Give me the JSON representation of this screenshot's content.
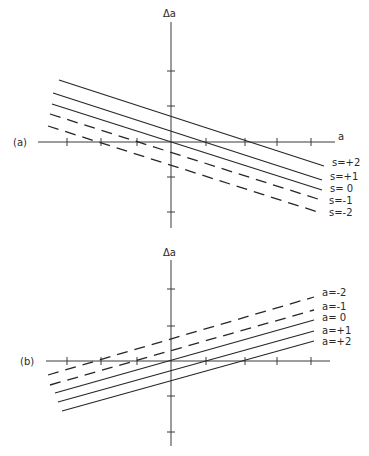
{
  "figure": {
    "panels": [
      {
        "id": "a",
        "panel_label": "(a)",
        "y_axis_label": "Δa",
        "x_axis_label": "a",
        "origin": [
          171,
          142
        ],
        "x_axis": [
          38,
          335
        ],
        "y_axis": [
          22,
          228
        ],
        "x_ticks": [
          67,
          101,
          137,
          206,
          245,
          277,
          311
        ],
        "y_ticks": [
          71,
          106,
          177,
          212
        ],
        "lines": [
          {
            "label": "s=+2",
            "style": "solid",
            "x1": 59,
            "y1": 80,
            "x2": 324,
            "y2": 166,
            "label_y": 162
          },
          {
            "label": "s=+1",
            "style": "solid",
            "x1": 53,
            "y1": 93,
            "x2": 322,
            "y2": 180,
            "label_y": 176
          },
          {
            "label": "s= 0",
            "style": "solid",
            "x1": 52,
            "y1": 104,
            "x2": 322,
            "y2": 190,
            "label_y": 188
          },
          {
            "label": "s=-1",
            "style": "dashed",
            "x1": 50,
            "y1": 114,
            "x2": 321,
            "y2": 200,
            "label_y": 200
          },
          {
            "label": "s=-2",
            "style": "dashed",
            "x1": 48,
            "y1": 126,
            "x2": 321,
            "y2": 213,
            "label_y": 212
          }
        ]
      },
      {
        "id": "b",
        "panel_label": "(b)",
        "y_axis_label": "Δa",
        "x_axis_label": "",
        "origin": [
          171,
          361
        ],
        "x_axis": [
          46,
          330
        ],
        "y_axis": [
          260,
          446
        ],
        "x_ticks": [
          67,
          101,
          137,
          206,
          245,
          277,
          311
        ],
        "y_ticks": [
          289,
          326,
          396,
          432
        ],
        "lines": [
          {
            "label": "a=-2",
            "style": "dashed",
            "x1": 48,
            "y1": 375,
            "x2": 314,
            "y2": 297,
            "label_y": 292
          },
          {
            "label": "a=-1",
            "style": "dashed",
            "x1": 50,
            "y1": 385,
            "x2": 314,
            "y2": 310,
            "label_y": 306
          },
          {
            "label": "a= 0",
            "style": "solid",
            "x1": 55,
            "y1": 393,
            "x2": 314,
            "y2": 320,
            "label_y": 317
          },
          {
            "label": "a=+1",
            "style": "solid",
            "x1": 58,
            "y1": 402,
            "x2": 314,
            "y2": 331,
            "label_y": 330
          },
          {
            "label": "a=+2",
            "style": "solid",
            "x1": 62,
            "y1": 411,
            "x2": 314,
            "y2": 341,
            "label_y": 341
          }
        ]
      }
    ]
  },
  "chart_data": [
    {
      "type": "line",
      "title": "(a)",
      "xlabel": "a",
      "ylabel": "Δa",
      "x": [
        -3.5,
        4.3
      ],
      "xlim": [
        -3.8,
        4.7
      ],
      "ylim": [
        -2.5,
        3.4
      ],
      "grid": false,
      "legend_position": "right, inline labels at line ends",
      "series": [
        {
          "name": "s=+2",
          "style": "solid",
          "values": [
            1.77,
            -0.69
          ]
        },
        {
          "name": "s=+1",
          "style": "solid",
          "values": [
            1.4,
            -1.09
          ]
        },
        {
          "name": "s= 0",
          "style": "solid",
          "values": [
            1.09,
            -1.37
          ]
        },
        {
          "name": "s=-1",
          "style": "dashed",
          "values": [
            0.8,
            -1.66
          ]
        },
        {
          "name": "s=-2",
          "style": "dashed",
          "values": [
            0.46,
            -2.03
          ]
        }
      ]
    },
    {
      "type": "line",
      "title": "(b)",
      "xlabel": "",
      "ylabel": "Δa",
      "x": [
        -3.5,
        4.0
      ],
      "xlim": [
        -3.6,
        4.5
      ],
      "ylim": [
        -2.4,
        2.9
      ],
      "grid": false,
      "legend_position": "right, inline labels at line ends",
      "series": [
        {
          "name": "a=-2",
          "style": "dashed",
          "values": [
            -0.4,
            1.83
          ]
        },
        {
          "name": "a=-1",
          "style": "dashed",
          "values": [
            -0.69,
            1.46
          ]
        },
        {
          "name": "a= 0",
          "style": "solid",
          "values": [
            -0.91,
            1.17
          ]
        },
        {
          "name": "a=+1",
          "style": "solid",
          "values": [
            -1.17,
            0.86
          ]
        },
        {
          "name": "a=+2",
          "style": "solid",
          "values": [
            -1.43,
            0.57
          ]
        }
      ]
    }
  ]
}
